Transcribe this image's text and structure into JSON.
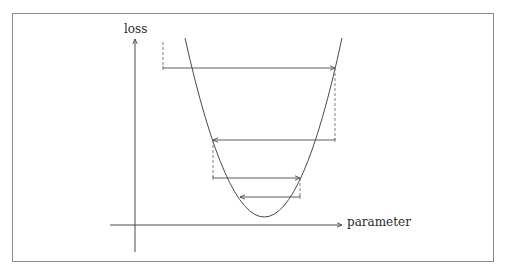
{
  "figure": {
    "type": "gradient-descent-oscillation",
    "frame_color": "#8a8a8a",
    "line_color": "#4a4a4a",
    "dashed_color": "#707070"
  },
  "axes": {
    "y_label": "loss",
    "x_label": "parameter"
  },
  "curve": {
    "shape": "parabola",
    "vertex": [
      265,
      217
    ],
    "left_top": [
      185,
      38
    ],
    "right_top": [
      342,
      38
    ]
  },
  "steps": [
    {
      "dashed_x": 163,
      "from_y": 42,
      "to_y": 68,
      "arrow_from_x": 163,
      "arrow_to_x": 335
    },
    {
      "dashed_x": 335,
      "from_y": 68,
      "to_y": 140,
      "arrow_from_x": 335,
      "arrow_to_x": 213
    },
    {
      "dashed_x": 213,
      "from_y": 140,
      "to_y": 178,
      "arrow_from_x": 213,
      "arrow_to_x": 300
    },
    {
      "dashed_x": 300,
      "from_y": 178,
      "to_y": 197,
      "arrow_from_x": 300,
      "arrow_to_x": 240
    }
  ]
}
